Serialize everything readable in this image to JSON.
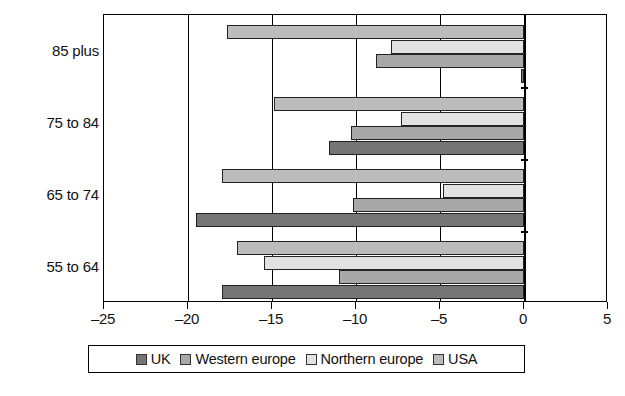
{
  "chart_data": {
    "type": "bar",
    "orientation": "horizontal",
    "title": "",
    "subtitle": "",
    "xlabel": "",
    "ylabel": "",
    "xlim": [
      -25,
      5
    ],
    "ylim": null,
    "grid": true,
    "legend_position": "bottom",
    "categories": [
      "55 to 64",
      "65 to 74",
      "75 to 84",
      "85 plus"
    ],
    "xticks": [
      -25,
      -20,
      -15,
      -10,
      -5,
      0,
      5
    ],
    "xtick_labels": [
      "–25",
      "–20",
      "–15",
      "–10",
      "–5",
      "0",
      "5"
    ],
    "series": [
      {
        "name": "UK",
        "color": "#757575",
        "values": [
          -18.0,
          -19.5,
          -11.6,
          -0.2
        ]
      },
      {
        "name": "Western europe",
        "color": "#a8a8a8",
        "values": [
          -11.0,
          -10.2,
          -10.3,
          -8.8
        ]
      },
      {
        "name": "Northern europe",
        "color": "#e2e2e2",
        "values": [
          -15.5,
          -4.8,
          -7.3,
          -7.9
        ]
      },
      {
        "name": "USA",
        "color": "#bcbcbc",
        "values": [
          -17.1,
          -18.0,
          -14.9,
          -17.7
        ]
      }
    ]
  },
  "legend": {
    "items": [
      {
        "label": "UK",
        "swatch": "#757575"
      },
      {
        "label": "Western europe",
        "swatch": "#a8a8a8"
      },
      {
        "label": "Northern europe",
        "swatch": "#e2e2e2"
      },
      {
        "label": "USA",
        "swatch": "#bcbcbc"
      }
    ]
  }
}
